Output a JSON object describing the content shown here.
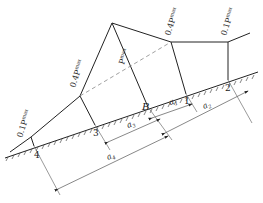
{
  "diagram": {
    "title": "",
    "loads": [
      {
        "id": "load-0-1-left",
        "label": "0.1P",
        "sub": "max"
      },
      {
        "id": "load-0-4-left",
        "label": "0.4P",
        "sub": "max"
      },
      {
        "id": "load-peak",
        "label": "P",
        "sub": "max"
      },
      {
        "id": "load-0-4-right",
        "label": "0.4P",
        "sub": "max"
      },
      {
        "id": "load-0-1-right",
        "label": "0.1P",
        "sub": "max"
      }
    ],
    "points": [
      {
        "id": "4",
        "label": "4"
      },
      {
        "id": "3",
        "label": "3"
      },
      {
        "id": "B",
        "label": "B"
      },
      {
        "id": "1",
        "label": "1"
      },
      {
        "id": "2",
        "label": "2"
      }
    ],
    "dimensions": [
      {
        "id": "a1",
        "label": "a",
        "sub": "1"
      },
      {
        "id": "a2",
        "label": "a",
        "sub": "2"
      },
      {
        "id": "a3",
        "label": "a",
        "sub": "3"
      },
      {
        "id": "a4",
        "label": "a",
        "sub": "4"
      }
    ],
    "colors": {
      "line": "#222222",
      "dashed": "#888888",
      "dim": "#555555"
    }
  }
}
